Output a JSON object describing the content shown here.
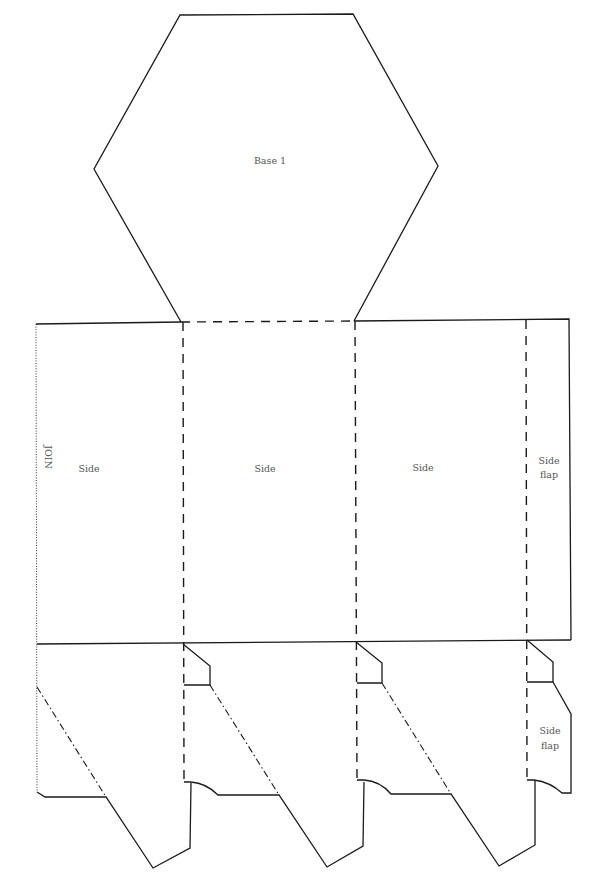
{
  "diagram": {
    "type": "hexagonal-prism-box-net",
    "labels": {
      "base": "Base 1",
      "join": "JOIN",
      "side_1": "Side",
      "side_2": "Side",
      "side_3": "Side",
      "side_flap_top_line1": "Side",
      "side_flap_top_line2": "flap",
      "side_flap_bottom_line1": "Side",
      "side_flap_bottom_line2": "flap"
    },
    "line_styles": {
      "cut": "solid",
      "fold": "dashed",
      "join_edge": "dotted",
      "glue_line": "dash-dot"
    },
    "colors": {
      "line": "#1a1a1a",
      "label": "#555555",
      "background": "#ffffff"
    }
  }
}
